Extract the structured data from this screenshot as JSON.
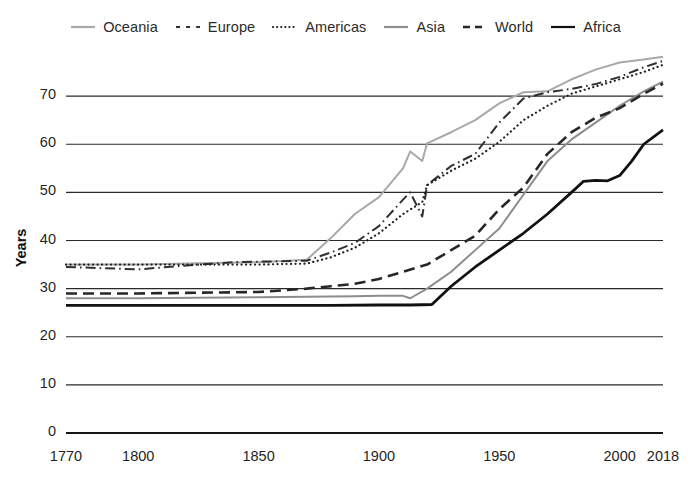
{
  "chart_data": {
    "type": "line",
    "title": "",
    "subtitle": "",
    "xlabel": "",
    "ylabel": "Years",
    "xlim": [
      1770,
      2018
    ],
    "ylim": [
      0,
      80
    ],
    "grid": "horizontal",
    "legend_position": "top",
    "y_ticks": [
      0,
      10,
      20,
      30,
      40,
      50,
      60,
      70
    ],
    "y_tick_labels": [
      "0",
      "10",
      "20",
      "30",
      "40",
      "50",
      "60",
      "70"
    ],
    "x_ticks": [
      1770,
      1800,
      1850,
      1900,
      1950,
      2000,
      2018
    ],
    "x_tick_labels": [
      "1770",
      "1800",
      "1850",
      "1900",
      "1950",
      "2000",
      "2018"
    ],
    "series": [
      {
        "name": "Oceania",
        "color": "#a8a8a8",
        "dash": "solid",
        "width": 2.0,
        "x": [
          1770,
          1800,
          1820,
          1850,
          1870,
          1880,
          1890,
          1900,
          1910,
          1913,
          1918,
          1920,
          1930,
          1940,
          1950,
          1960,
          1970,
          1980,
          1990,
          2000,
          2010,
          2018
        ],
        "y": [
          35.0,
          35.0,
          35.2,
          35.5,
          36.0,
          40.5,
          45.5,
          49.0,
          55.0,
          58.5,
          56.5,
          60.2,
          62.5,
          65.0,
          68.5,
          70.8,
          71.0,
          73.5,
          75.5,
          77.0,
          77.6,
          78.2
        ]
      },
      {
        "name": "Europe",
        "color": "#2f2f2f",
        "dash": "dashdot",
        "width": 2.0,
        "x": [
          1770,
          1800,
          1820,
          1840,
          1850,
          1870,
          1880,
          1890,
          1900,
          1910,
          1913,
          1918,
          1920,
          1930,
          1940,
          1950,
          1960,
          1970,
          1980,
          1990,
          2000,
          2010,
          2018
        ],
        "y": [
          34.5,
          34.0,
          34.8,
          35.5,
          35.6,
          35.8,
          37.5,
          39.5,
          43.0,
          48.5,
          50.0,
          45.0,
          51.5,
          55.5,
          58.0,
          64.5,
          69.5,
          70.8,
          71.5,
          72.5,
          74.0,
          76.0,
          77.3
        ]
      },
      {
        "name": "Americas",
        "color": "#1f1f1f",
        "dash": "dotted",
        "width": 2.2,
        "x": [
          1770,
          1800,
          1820,
          1850,
          1870,
          1880,
          1890,
          1900,
          1910,
          1918,
          1920,
          1930,
          1940,
          1950,
          1960,
          1970,
          1980,
          1990,
          2000,
          2010,
          2018
        ],
        "y": [
          35.0,
          35.0,
          35.0,
          35.0,
          35.2,
          36.5,
          38.5,
          41.5,
          45.5,
          48.0,
          51.5,
          54.5,
          57.0,
          60.5,
          65.0,
          68.0,
          70.5,
          72.0,
          73.5,
          75.0,
          76.5
        ]
      },
      {
        "name": "Asia",
        "color": "#8d8d8d",
        "dash": "solid",
        "width": 2.0,
        "x": [
          1770,
          1800,
          1850,
          1870,
          1890,
          1900,
          1910,
          1913,
          1920,
          1930,
          1940,
          1950,
          1955,
          1960,
          1965,
          1970,
          1980,
          1990,
          2000,
          2010,
          2018
        ],
        "y": [
          28.0,
          28.0,
          28.2,
          28.3,
          28.4,
          28.5,
          28.5,
          28.0,
          30.0,
          33.5,
          38.0,
          42.5,
          46.0,
          49.5,
          53.0,
          56.5,
          61.0,
          64.5,
          68.0,
          71.0,
          73.0
        ]
      },
      {
        "name": "World",
        "color": "#272727",
        "dash": "dashed",
        "width": 2.6,
        "x": [
          1770,
          1800,
          1850,
          1870,
          1880,
          1890,
          1900,
          1910,
          1920,
          1930,
          1940,
          1950,
          1960,
          1970,
          1980,
          1990,
          2000,
          2010,
          2018
        ],
        "y": [
          29.0,
          29.0,
          29.3,
          30.0,
          30.5,
          31.0,
          32.0,
          33.5,
          35.0,
          38.0,
          41.0,
          46.5,
          51.0,
          58.0,
          62.5,
          65.5,
          67.5,
          70.5,
          72.6
        ]
      },
      {
        "name": "Africa",
        "color": "#111111",
        "dash": "solid",
        "width": 2.8,
        "x": [
          1770,
          1800,
          1850,
          1880,
          1900,
          1913,
          1922,
          1930,
          1940,
          1950,
          1960,
          1970,
          1980,
          1985,
          1990,
          1995,
          2000,
          2005,
          2010,
          2018
        ],
        "y": [
          26.5,
          26.5,
          26.5,
          26.5,
          26.6,
          26.6,
          26.7,
          30.5,
          34.5,
          38.0,
          41.5,
          45.5,
          50.0,
          52.3,
          52.5,
          52.4,
          53.5,
          56.5,
          60.0,
          63.0
        ]
      }
    ]
  },
  "legend": {
    "items": [
      {
        "label": "Oceania",
        "color": "#a8a8a8",
        "dash": "solid"
      },
      {
        "label": "Europe",
        "color": "#2f2f2f",
        "dash": "dashdot"
      },
      {
        "label": "Americas",
        "color": "#1f1f1f",
        "dash": "dotted"
      },
      {
        "label": "Asia",
        "color": "#8d8d8d",
        "dash": "solid"
      },
      {
        "label": "World",
        "color": "#272727",
        "dash": "dashed"
      },
      {
        "label": "Africa",
        "color": "#111111",
        "dash": "solid"
      }
    ]
  },
  "axes": {
    "y_title": "Years"
  }
}
